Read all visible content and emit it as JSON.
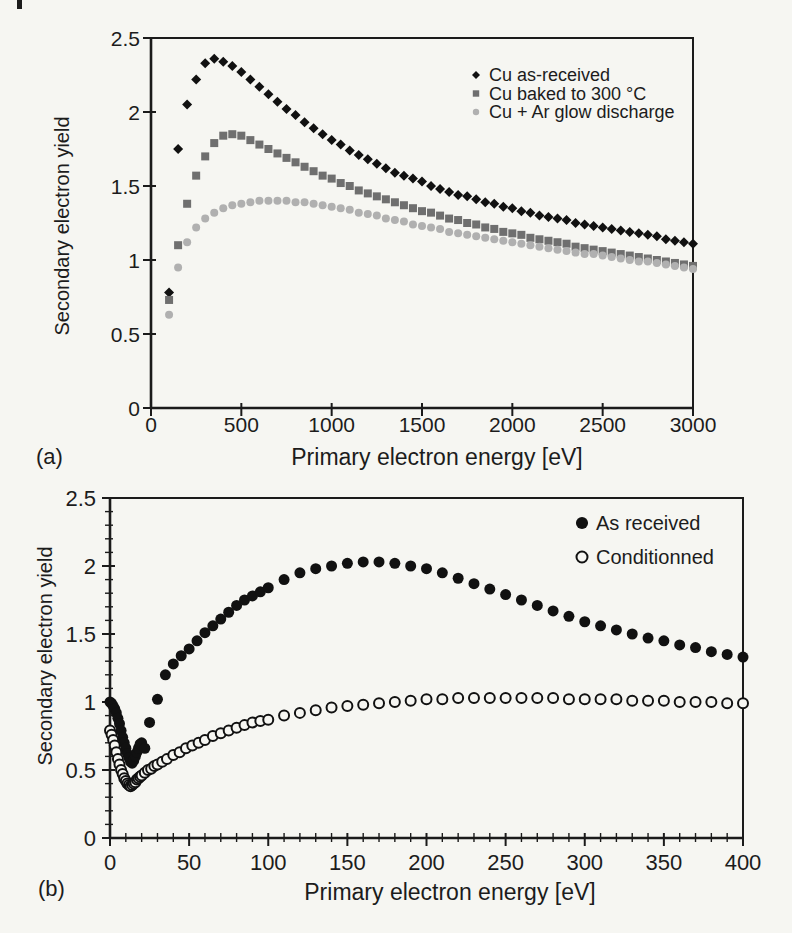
{
  "page": {
    "background": "#f6f6f2",
    "panel_a_label": "(a)",
    "panel_b_label": "(b)"
  },
  "chart_data": [
    {
      "id": "a",
      "type": "scatter",
      "xlabel": "Primary electron energy [eV]",
      "ylabel": "Secondary electron yield",
      "xlim": [
        0,
        3000
      ],
      "ylim": [
        0,
        2.5
      ],
      "xticks": [
        0,
        500,
        1000,
        1500,
        2000,
        2500,
        3000
      ],
      "xtick_labels": [
        "0",
        "500",
        "1000",
        "1500",
        "2000",
        "2500",
        "3000"
      ],
      "yticks": [
        0,
        0.5,
        1,
        1.5,
        2,
        2.5
      ],
      "ytick_labels": [
        "0",
        "0.5",
        "1",
        "1.5",
        "2",
        "2.5"
      ],
      "frame": true,
      "grid": false,
      "legend_position": "top-right",
      "series": [
        {
          "name": "Cu as-received",
          "marker": "diamond",
          "color": "#111111",
          "x": [
            100,
            150,
            200,
            250,
            300,
            350,
            400,
            450,
            500,
            550,
            600,
            650,
            700,
            750,
            800,
            850,
            900,
            950,
            1000,
            1050,
            1100,
            1150,
            1200,
            1250,
            1300,
            1350,
            1400,
            1450,
            1500,
            1550,
            1600,
            1650,
            1700,
            1750,
            1800,
            1850,
            1900,
            1950,
            2000,
            2050,
            2100,
            2150,
            2200,
            2250,
            2300,
            2350,
            2400,
            2450,
            2500,
            2550,
            2600,
            2650,
            2700,
            2750,
            2800,
            2850,
            2900,
            2950,
            3000
          ],
          "y": [
            0.78,
            1.75,
            2.05,
            2.22,
            2.33,
            2.36,
            2.34,
            2.31,
            2.27,
            2.22,
            2.17,
            2.12,
            2.07,
            2.02,
            1.98,
            1.93,
            1.89,
            1.85,
            1.81,
            1.78,
            1.74,
            1.71,
            1.68,
            1.65,
            1.62,
            1.59,
            1.57,
            1.55,
            1.53,
            1.5,
            1.48,
            1.46,
            1.44,
            1.43,
            1.41,
            1.39,
            1.38,
            1.36,
            1.35,
            1.33,
            1.32,
            1.3,
            1.29,
            1.28,
            1.27,
            1.25,
            1.24,
            1.23,
            1.22,
            1.21,
            1.2,
            1.19,
            1.18,
            1.17,
            1.16,
            1.14,
            1.13,
            1.12,
            1.11
          ]
        },
        {
          "name": "Cu baked to 300 °C",
          "marker": "square",
          "color": "#6f6f6f",
          "x": [
            100,
            150,
            200,
            250,
            300,
            350,
            400,
            450,
            500,
            550,
            600,
            650,
            700,
            750,
            800,
            850,
            900,
            950,
            1000,
            1050,
            1100,
            1150,
            1200,
            1250,
            1300,
            1350,
            1400,
            1450,
            1500,
            1550,
            1600,
            1650,
            1700,
            1750,
            1800,
            1850,
            1900,
            1950,
            2000,
            2050,
            2100,
            2150,
            2200,
            2250,
            2300,
            2350,
            2400,
            2450,
            2500,
            2550,
            2600,
            2650,
            2700,
            2750,
            2800,
            2850,
            2900,
            2950,
            3000
          ],
          "y": [
            0.73,
            1.1,
            1.38,
            1.57,
            1.7,
            1.79,
            1.84,
            1.85,
            1.84,
            1.81,
            1.78,
            1.75,
            1.72,
            1.69,
            1.66,
            1.63,
            1.6,
            1.57,
            1.55,
            1.52,
            1.5,
            1.47,
            1.45,
            1.43,
            1.41,
            1.39,
            1.37,
            1.35,
            1.33,
            1.32,
            1.3,
            1.28,
            1.27,
            1.25,
            1.24,
            1.22,
            1.21,
            1.19,
            1.18,
            1.17,
            1.15,
            1.14,
            1.13,
            1.12,
            1.11,
            1.09,
            1.08,
            1.07,
            1.06,
            1.05,
            1.04,
            1.03,
            1.02,
            1.01,
            1.0,
            0.99,
            0.98,
            0.97,
            0.96
          ]
        },
        {
          "name": "Cu + Ar glow discharge",
          "marker": "circle",
          "color": "#b0b0b0",
          "x": [
            100,
            150,
            200,
            250,
            300,
            350,
            400,
            450,
            500,
            550,
            600,
            650,
            700,
            750,
            800,
            850,
            900,
            950,
            1000,
            1050,
            1100,
            1150,
            1200,
            1250,
            1300,
            1350,
            1400,
            1450,
            1500,
            1550,
            1600,
            1650,
            1700,
            1750,
            1800,
            1850,
            1900,
            1950,
            2000,
            2050,
            2100,
            2150,
            2200,
            2250,
            2300,
            2350,
            2400,
            2450,
            2500,
            2550,
            2600,
            2650,
            2700,
            2750,
            2800,
            2850,
            2900,
            2950,
            3000
          ],
          "y": [
            0.63,
            0.95,
            1.12,
            1.22,
            1.28,
            1.32,
            1.35,
            1.37,
            1.38,
            1.39,
            1.4,
            1.4,
            1.4,
            1.4,
            1.39,
            1.39,
            1.38,
            1.37,
            1.36,
            1.35,
            1.34,
            1.32,
            1.31,
            1.3,
            1.28,
            1.27,
            1.26,
            1.24,
            1.23,
            1.22,
            1.21,
            1.19,
            1.18,
            1.17,
            1.16,
            1.15,
            1.14,
            1.13,
            1.12,
            1.11,
            1.1,
            1.09,
            1.08,
            1.07,
            1.06,
            1.05,
            1.04,
            1.04,
            1.03,
            1.02,
            1.01,
            1.0,
            0.99,
            0.99,
            0.98,
            0.97,
            0.96,
            0.95,
            0.94
          ]
        }
      ]
    },
    {
      "id": "b",
      "type": "scatter",
      "xlabel": "Primary electron energy [eV]",
      "ylabel": "Secondary electron yield",
      "xlim": [
        0,
        400
      ],
      "ylim": [
        0,
        2.5
      ],
      "xticks": [
        0,
        50,
        100,
        150,
        200,
        250,
        300,
        350,
        400
      ],
      "xtick_labels": [
        "0",
        "50",
        "100",
        "150",
        "200",
        "250",
        "300",
        "350",
        "400"
      ],
      "yticks": [
        0,
        0.5,
        1,
        1.5,
        2,
        2.5
      ],
      "ytick_labels": [
        "0",
        "0.5",
        "1",
        "1.5",
        "2",
        "2.5"
      ],
      "x_minor_step": 10,
      "y_minor_step": 0.1,
      "frame": true,
      "grid": false,
      "legend_position": "top-right",
      "series": [
        {
          "name": "As received",
          "marker": "dot",
          "color": "#111111",
          "x": [
            0,
            1,
            2,
            3,
            4,
            5,
            6,
            7,
            8,
            9,
            10,
            11,
            12,
            13,
            14,
            15,
            16,
            17,
            18,
            19,
            20,
            22,
            25,
            30,
            35,
            40,
            45,
            50,
            55,
            60,
            65,
            70,
            75,
            80,
            85,
            90,
            95,
            100,
            110,
            120,
            130,
            140,
            150,
            160,
            170,
            180,
            190,
            200,
            210,
            220,
            230,
            240,
            250,
            260,
            270,
            280,
            290,
            300,
            310,
            320,
            330,
            340,
            350,
            360,
            370,
            380,
            390,
            400
          ],
          "y": [
            1.0,
            0.99,
            0.97,
            0.95,
            0.92,
            0.88,
            0.84,
            0.79,
            0.74,
            0.7,
            0.66,
            0.62,
            0.59,
            0.56,
            0.55,
            0.57,
            0.6,
            0.63,
            0.66,
            0.69,
            0.7,
            0.66,
            0.85,
            1.02,
            1.2,
            1.28,
            1.34,
            1.39,
            1.45,
            1.51,
            1.56,
            1.61,
            1.66,
            1.71,
            1.75,
            1.78,
            1.81,
            1.84,
            1.9,
            1.95,
            1.98,
            2.0,
            2.02,
            2.03,
            2.03,
            2.02,
            2.0,
            1.98,
            1.95,
            1.91,
            1.87,
            1.83,
            1.79,
            1.75,
            1.71,
            1.67,
            1.63,
            1.59,
            1.56,
            1.53,
            1.5,
            1.47,
            1.45,
            1.42,
            1.4,
            1.37,
            1.35,
            1.33
          ]
        },
        {
          "name": "Conditionned",
          "marker": "circle-open",
          "color": "#111111",
          "x": [
            0,
            1,
            2,
            3,
            4,
            5,
            6,
            7,
            8,
            9,
            10,
            11,
            12,
            13,
            14,
            15,
            16,
            17,
            18,
            19,
            20,
            22,
            24,
            26,
            28,
            30,
            33,
            36,
            40,
            44,
            48,
            52,
            56,
            60,
            65,
            70,
            75,
            80,
            85,
            90,
            95,
            100,
            110,
            120,
            130,
            140,
            150,
            160,
            170,
            180,
            190,
            200,
            210,
            220,
            230,
            240,
            250,
            260,
            270,
            280,
            290,
            300,
            310,
            320,
            330,
            340,
            350,
            360,
            370,
            380,
            390,
            400
          ],
          "y": [
            0.79,
            0.76,
            0.72,
            0.68,
            0.63,
            0.58,
            0.54,
            0.5,
            0.47,
            0.44,
            0.42,
            0.4,
            0.39,
            0.38,
            0.39,
            0.4,
            0.41,
            0.43,
            0.44,
            0.45,
            0.46,
            0.48,
            0.5,
            0.51,
            0.53,
            0.54,
            0.56,
            0.58,
            0.61,
            0.63,
            0.66,
            0.68,
            0.7,
            0.72,
            0.75,
            0.77,
            0.79,
            0.81,
            0.83,
            0.85,
            0.86,
            0.87,
            0.9,
            0.92,
            0.94,
            0.96,
            0.97,
            0.98,
            0.99,
            1.0,
            1.01,
            1.02,
            1.02,
            1.03,
            1.03,
            1.03,
            1.03,
            1.03,
            1.03,
            1.03,
            1.02,
            1.02,
            1.02,
            1.02,
            1.01,
            1.01,
            1.01,
            1.0,
            1.0,
            1.0,
            0.99,
            0.99
          ]
        }
      ]
    }
  ]
}
